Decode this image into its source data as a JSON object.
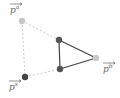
{
  "diagram": {
    "labels": {
      "pa": {
        "base": "p",
        "sup": "a"
      },
      "pb": {
        "base": "p",
        "sup": "b"
      },
      "ps": {
        "base": "p",
        "sup": "s"
      }
    },
    "colors": {
      "dashed": "#cccccc",
      "solid": "#444444",
      "light_dot": "#c8c8c8",
      "dark_dot": "#555555",
      "label": "#666666"
    },
    "points": {
      "pa": [
        22,
        21
      ],
      "upper": [
        59,
        40
      ],
      "pb": [
        96,
        58
      ],
      "lower": [
        60,
        69
      ],
      "ps": [
        25,
        77
      ]
    }
  }
}
